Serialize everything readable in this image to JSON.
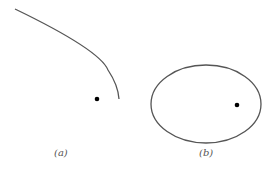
{
  "panels": [
    {
      "label": "(a)",
      "shape": "parabola-arc"
    },
    {
      "label": "(b)",
      "shape": "ellipse"
    }
  ],
  "colors": {
    "stroke": "#555555",
    "dot": "#000000"
  }
}
